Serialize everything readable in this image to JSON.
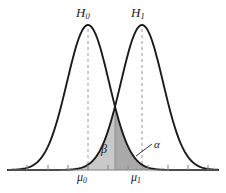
{
  "figure": {
    "title": "",
    "background_color": "#ffffff",
    "curve_color": "#1a1a1a",
    "axis_color": "#808080",
    "dashed_line_color": "#9a9a9a",
    "beta_fill_color": "#c9c9c9",
    "alpha_fill_color": "#a9a9a9",
    "labels": {
      "h0": {
        "base": "H",
        "sub": "0"
      },
      "h1": {
        "base": "H",
        "sub": "1"
      },
      "mu0": {
        "base": "μ",
        "sub": "0"
      },
      "mu1": {
        "base": "μ",
        "sub": "1"
      },
      "beta": "β",
      "alpha": "α"
    }
  },
  "chart_data": {
    "type": "line",
    "title": "",
    "xlabel": "",
    "ylabel": "",
    "grid": false,
    "legend": "none",
    "axis": {
      "baseline_y_px": 170,
      "x_start_px": 8,
      "x_end_px": 218,
      "tick_positions_px": [
        27,
        48,
        68,
        88,
        108,
        128,
        148,
        168,
        188,
        208
      ],
      "tick_length_px": 5,
      "tick_labels": [
        "",
        "",
        "",
        "μ₀",
        "",
        "",
        "μ₁",
        "",
        "",
        ""
      ]
    },
    "series": [
      {
        "name": "H0",
        "label": "H₀",
        "distribution": "normal",
        "mean_px": 88,
        "sigma_px": 21,
        "peak_y_px": 25,
        "mean_label": "μ₀",
        "color": "#1a1a1a",
        "dashed_mean_line": true
      },
      {
        "name": "H1",
        "label": "H₁",
        "distribution": "normal",
        "mean_px": 142,
        "sigma_px": 21,
        "peak_y_px": 25,
        "mean_label": "μ₁",
        "color": "#1a1a1a",
        "dashed_mean_line": true
      }
    ],
    "threshold": {
      "x_px": 115,
      "label": "",
      "drawn": true
    },
    "shaded_regions": [
      {
        "name": "beta",
        "label": "β",
        "description": "Type II error region: area under H1 curve to the left of the decision threshold",
        "fill": "#c9c9c9",
        "x_from_px": 72,
        "x_to_px": 115
      },
      {
        "name": "alpha",
        "label": "α",
        "description": "Type I error region: area under H0 curve to the right of the decision threshold",
        "fill": "#a9a9a9",
        "x_from_px": 115,
        "x_to_px": 160
      }
    ],
    "annotations": [
      {
        "name": "alpha-leader",
        "text": "α",
        "from_px": [
          152,
          144
        ],
        "to_px": [
          136,
          156
        ]
      }
    ]
  }
}
